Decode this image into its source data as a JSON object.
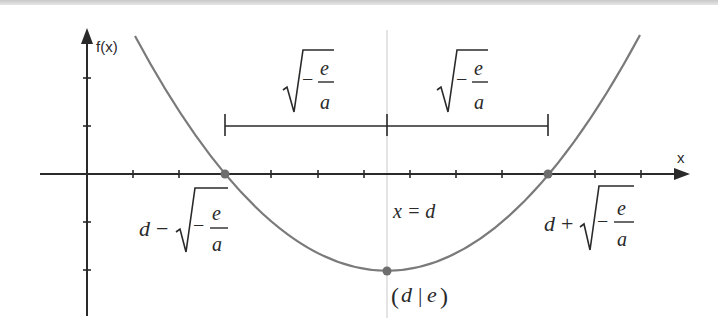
{
  "diagram": {
    "type": "parabola-roots-vertex",
    "axes": {
      "x_label": "x",
      "y_label": "f(x)"
    },
    "colors": {
      "axis": "#2a2a2a",
      "curve": "#7a7a7a",
      "points": "#6e6e6e",
      "symmetry_line": "#d0d0d0",
      "text": "#2a2a2a"
    },
    "brackets": {
      "left_label": {
        "radicand_minus": "−",
        "numerator": "e",
        "denominator": "a"
      },
      "right_label": {
        "radicand_minus": "−",
        "numerator": "e",
        "denominator": "a"
      }
    },
    "labels": {
      "left_root": {
        "prefix": "d",
        "operator": "−",
        "numerator": "e",
        "denominator": "a",
        "inner_minus": "−"
      },
      "right_root": {
        "prefix": "d",
        "operator": "+",
        "numerator": "e",
        "denominator": "a",
        "inner_minus": "−"
      },
      "symmetry_axis": "x = d",
      "vertex": {
        "open": "(",
        "d": "d",
        "sep": "|",
        "e": "e",
        "close": ")"
      }
    },
    "points": [
      {
        "name": "left-root",
        "x": 225,
        "y": 174
      },
      {
        "name": "right-root",
        "x": 548,
        "y": 174
      },
      {
        "name": "vertex",
        "x": 387,
        "y": 271
      }
    ]
  }
}
